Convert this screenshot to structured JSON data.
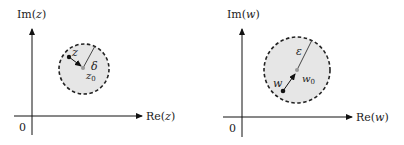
{
  "diagram": {
    "left_panel": {
      "y_axis_label": "Im(z)",
      "x_axis_label": "Re(z)",
      "origin_label": "0",
      "point_label": "z",
      "center_label": "z",
      "center_subscript": "0",
      "radius_label": "δ",
      "disk_fill": "#e6e6e6",
      "boundary_style": "dashed"
    },
    "right_panel": {
      "y_axis_label": "Im(w)",
      "x_axis_label": "Re(w)",
      "origin_label": "0",
      "point_label": "w",
      "center_label": "w",
      "center_subscript": "0",
      "radius_label": "ε",
      "disk_fill": "#e6e6e6",
      "boundary_style": "dashed"
    }
  }
}
